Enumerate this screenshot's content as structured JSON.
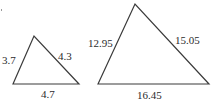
{
  "figure": {
    "colors": {
      "stroke": "#3a3a3a",
      "text": "#2b2b2b",
      "background": "#ffffff"
    },
    "triangles": [
      {
        "name": "small-triangle",
        "sides": {
          "left": "3.7",
          "right": "4.3",
          "base": "4.7"
        }
      },
      {
        "name": "large-triangle",
        "sides": {
          "left": "12.95",
          "right": "15.05",
          "base": "16.45"
        }
      }
    ]
  }
}
